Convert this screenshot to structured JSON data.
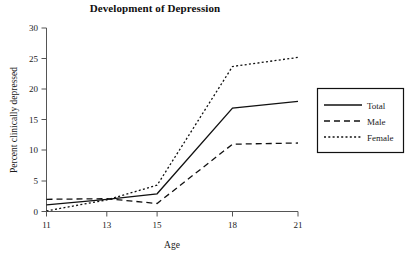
{
  "chart_data": {
    "type": "line",
    "title": "Development of Depression",
    "xlabel": "Age",
    "ylabel": "Percent clinically depressed",
    "x": [
      11,
      13,
      15,
      18,
      21
    ],
    "xtick_labels": [
      "11",
      "13",
      "15",
      "18",
      "21"
    ],
    "ytick_labels": [
      "0",
      "5",
      "10",
      "15",
      "20",
      "25",
      "30"
    ],
    "yticks": [
      0,
      5,
      10,
      15,
      20,
      25,
      30
    ],
    "xlim": [
      11,
      21
    ],
    "ylim": [
      0,
      30
    ],
    "grid": false,
    "legend_position": "right",
    "series": [
      {
        "name": "Total",
        "style": "solid",
        "values": [
          1.1,
          2.0,
          2.9,
          16.9,
          18.0
        ]
      },
      {
        "name": "Male",
        "style": "dashed",
        "values": [
          2.0,
          2.1,
          1.3,
          11.0,
          11.2
        ]
      },
      {
        "name": "Female",
        "style": "dotted",
        "values": [
          0.1,
          1.9,
          4.3,
          23.7,
          25.2
        ]
      }
    ]
  },
  "legend": {
    "items": [
      {
        "label": "Total",
        "style": "solid"
      },
      {
        "label": "Male",
        "style": "dashed"
      },
      {
        "label": "Female",
        "style": "dotted"
      }
    ]
  }
}
